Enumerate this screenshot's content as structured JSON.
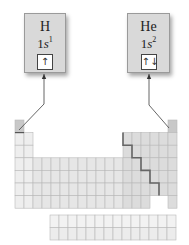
{
  "diagram": {
    "type": "electron-configuration-periodic-table",
    "elements": [
      {
        "symbol": "H",
        "config_prefix": "1",
        "config_orbital": "s",
        "config_superscript": "1",
        "orbital_arrows": "↑",
        "table_position": {
          "period": 1,
          "group": 1
        }
      },
      {
        "symbol": "He",
        "config_prefix": "1",
        "config_orbital": "s",
        "config_superscript": "2",
        "orbital_arrows": "↑↓",
        "table_position": {
          "period": 1,
          "group": 18
        }
      }
    ],
    "periodic_table": {
      "columns": 18,
      "rows": 7,
      "f_block_rows": 2,
      "f_block_columns": 14,
      "staircase_line": "metal/nonmetal boundary"
    },
    "colors": {
      "box_fill": "#d9d9d9",
      "highlight_cell": "#c8c8c8",
      "s_block": "#eeeeee",
      "d_block": "#e6e6e6",
      "p_block": "#dcdcdc",
      "f_block": "#ececec",
      "grid_line": "#b8b8b8",
      "staircase": "#666666",
      "connector": "#555555"
    }
  }
}
